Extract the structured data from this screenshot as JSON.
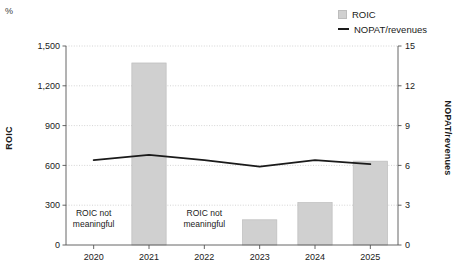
{
  "unit_marker": "%",
  "legend": {
    "position": "top-right",
    "items": [
      {
        "label": "ROIC",
        "marker": "square-swatch",
        "color": "#d0d0d0"
      },
      {
        "label": "NOPAT/revenues",
        "marker": "line-swatch",
        "color": "#1a1a1a"
      }
    ]
  },
  "axes": {
    "left_title": "ROIC",
    "right_title": "NOPAT/revenues",
    "left_ticks": [
      "0",
      "300",
      "600",
      "900",
      "1,200",
      "1,500"
    ],
    "right_ticks": [
      "0",
      "3",
      "6",
      "9",
      "12",
      "15"
    ],
    "x_ticks": [
      "2020",
      "2021",
      "2022",
      "2023",
      "2024",
      "2025"
    ]
  },
  "annotations": [
    {
      "category": "2020",
      "line1": "ROIC not",
      "line2": "meaningful"
    },
    {
      "category": "2022",
      "line1": "ROIC not",
      "line2": "meaningful"
    }
  ],
  "chart_data": {
    "type": "bar",
    "title": "",
    "subtitle": "",
    "xlabel": "",
    "ylabel": "ROIC",
    "y2label": "NOPAT/revenues",
    "unit": "%",
    "categories": [
      "2020",
      "2021",
      "2022",
      "2023",
      "2024",
      "2025"
    ],
    "ylim": [
      0,
      1500
    ],
    "y2lim": [
      0,
      15
    ],
    "yticks": [
      0,
      300,
      600,
      900,
      1200,
      1500
    ],
    "y2ticks": [
      0,
      3,
      6,
      9,
      12,
      15
    ],
    "grid": true,
    "legend_position": "top-right",
    "series": [
      {
        "name": "ROIC",
        "type": "bar",
        "axis": "left",
        "color": "#d0d0d0",
        "values": [
          null,
          1372,
          null,
          190,
          320,
          632
        ],
        "null_note": "ROIC not meaningful"
      },
      {
        "name": "NOPAT/revenues",
        "type": "line",
        "axis": "right",
        "color": "#1a1a1a",
        "values": [
          6.4,
          6.8,
          6.4,
          5.9,
          6.4,
          6.1
        ]
      }
    ]
  },
  "geometry": {
    "plot_left": 66,
    "plot_right": 398,
    "plot_top": 46,
    "plot_bottom": 245
  }
}
